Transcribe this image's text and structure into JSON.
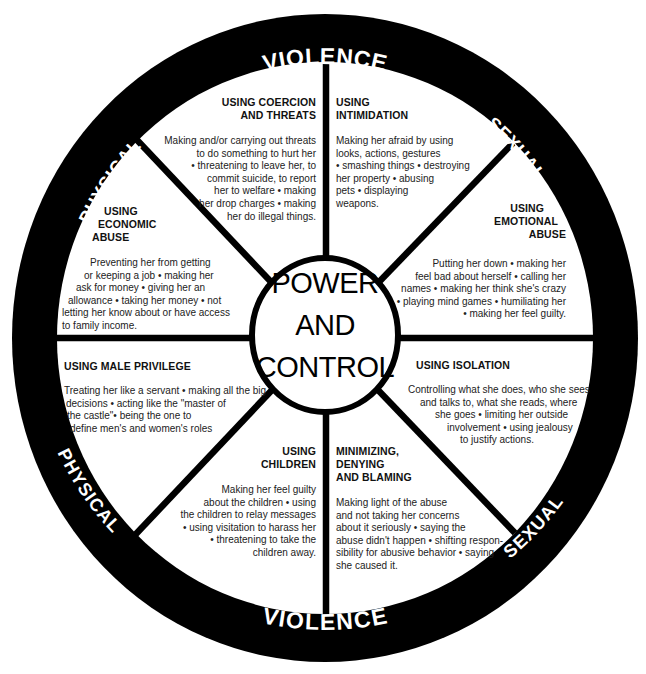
{
  "diagram": {
    "type": "wheel",
    "hub": {
      "lines": [
        "POWER",
        "AND",
        "CONTROL"
      ]
    },
    "ring": {
      "top": {
        "left": "PHYSICAL",
        "center": "VIOLENCE",
        "right": "SEXUAL"
      },
      "bottom": {
        "left": "PHYSICAL",
        "center": "VIOLENCE",
        "right": "SEXUAL"
      }
    },
    "colors": {
      "ring": "#000000",
      "background": "#ffffff",
      "text": "#1a1a1a"
    },
    "segments": [
      {
        "id": "coercion",
        "title": [
          "USING COERCION",
          "AND THREATS"
        ],
        "body": [
          "Making and/or carrying out threats",
          "to do something to hurt her",
          "• threatening to leave her, to",
          "commit suicide, to report",
          "her to welfare • making",
          "her drop charges • making",
          "her do illegal things."
        ]
      },
      {
        "id": "intimidation",
        "title": [
          "USING",
          "INTIMIDATION"
        ],
        "body": [
          "Making her afraid by using",
          "looks, actions, gestures",
          "• smashing things • destroying",
          "her property • abusing",
          "pets • displaying",
          "weapons."
        ]
      },
      {
        "id": "emotional",
        "title": [
          "USING",
          "EMOTIONAL",
          "ABUSE"
        ],
        "body": [
          "Putting her down • making her",
          "feel bad about herself • calling her",
          "names • making her think she's crazy",
          "• playing mind games • humiliating her",
          "• making her feel guilty."
        ]
      },
      {
        "id": "isolation",
        "title": [
          "USING ISOLATION"
        ],
        "body": [
          "Controlling what she does, who she sees",
          "and talks to, what she reads, where",
          "she goes • limiting her outside",
          "involvement • using jealousy",
          "to justify actions."
        ]
      },
      {
        "id": "minimizing",
        "title": [
          "MINIMIZING,",
          "DENYING",
          "AND BLAMING"
        ],
        "body": [
          "Making light of the abuse",
          "and not taking her concerns",
          "about it seriously • saying the",
          "abuse didn't happen • shifting respon-",
          "sibility for abusive behavior • saying",
          "she caused it."
        ]
      },
      {
        "id": "children",
        "title": [
          "USING",
          "CHILDREN"
        ],
        "body": [
          "Making her feel guilty",
          "about the children • using",
          "the children to relay messages",
          "• using visitation to harass her",
          "• threatening to take the",
          "children away."
        ]
      },
      {
        "id": "male-privilege",
        "title": [
          "USING MALE PRIVILEGE"
        ],
        "body": [
          "Treating her like a servant • making all the big",
          "decisions • acting like the \"master of",
          "the castle\"• being the one to",
          "define men's and women's roles"
        ]
      },
      {
        "id": "economic",
        "title": [
          "USING",
          "ECONOMIC",
          "ABUSE"
        ],
        "body": [
          "Preventing her from getting",
          "or keeping a job • making her",
          "ask for money • giving her an",
          "allowance • taking her money • not",
          "letting her know about or have access",
          "to family income."
        ]
      }
    ]
  }
}
